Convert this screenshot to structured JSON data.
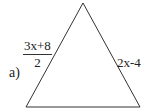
{
  "problem": {
    "label": "a)",
    "shape": "triangle",
    "left_side": {
      "numerator": "3x+8",
      "denominator": "2"
    },
    "right_side": "2x-4"
  },
  "colors": {
    "stroke": "#333333",
    "text": "#222222",
    "background": "#ffffff"
  }
}
